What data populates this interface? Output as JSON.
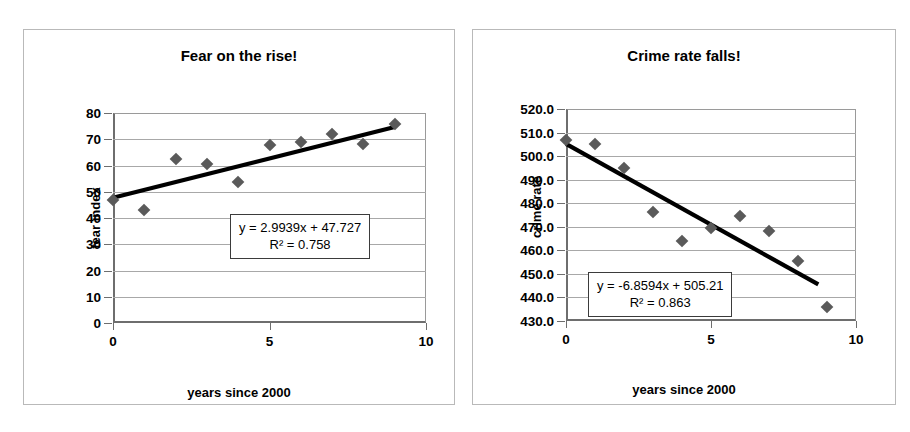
{
  "page": {
    "background": "#ffffff",
    "frame_color": "#b9b9b9"
  },
  "panels": [
    {
      "id": "fear",
      "title": "Fear on the rise!",
      "xlabel": "years since 2000",
      "ylabel": "fear index",
      "equation": "y = 2.9939x + 47.727",
      "r_squared": "R² = 0.758",
      "yticks": [
        "0",
        "10",
        "20",
        "30",
        "40",
        "50",
        "60",
        "70",
        "80"
      ],
      "xticks": [
        "0",
        "5",
        "10"
      ]
    },
    {
      "id": "crime",
      "title": "Crime rate falls!",
      "xlabel": "years since 2000",
      "ylabel": "crime rate",
      "equation": "y = -6.8594x + 505.21",
      "r_squared": "R² = 0.863",
      "yticks": [
        "430.0",
        "440.0",
        "450.0",
        "460.0",
        "470.0",
        "480.0",
        "490.0",
        "500.0",
        "510.0",
        "520.0"
      ],
      "xticks": [
        "0",
        "5",
        "10"
      ]
    }
  ],
  "chart_data": [
    {
      "type": "scatter",
      "title": "Fear on the rise!",
      "xlabel": "years since 2000",
      "ylabel": "fear index",
      "x": [
        0,
        1,
        2,
        3,
        4,
        5,
        6,
        7,
        8,
        9
      ],
      "y": [
        47.0,
        43.0,
        62.3,
        60.5,
        53.6,
        67.7,
        69.0,
        72.0,
        68.2,
        75.8
      ],
      "xlim": [
        0,
        10
      ],
      "ylim": [
        0,
        80
      ],
      "xtick_values": [
        0,
        5,
        10
      ],
      "ytick_values": [
        0,
        10,
        20,
        30,
        40,
        50,
        60,
        70,
        80
      ],
      "grid": "horizontal",
      "legend": "none",
      "marker": "diamond",
      "marker_color": "#5a5a5a",
      "trendline": {
        "type": "linear",
        "slope": 2.9939,
        "intercept": 47.727,
        "equation": "y = 2.9939x + 47.727",
        "r_squared": 0.758,
        "label": "R² = 0.758",
        "color": "#000000",
        "x_range": [
          0,
          9
        ]
      }
    },
    {
      "type": "scatter",
      "title": "Crime rate falls!",
      "xlabel": "years since 2000",
      "ylabel": "crime rate",
      "x": [
        0,
        1,
        2,
        3,
        4,
        5,
        6,
        7,
        8,
        9
      ],
      "y": [
        507.0,
        505.0,
        495.0,
        476.3,
        464.0,
        469.5,
        474.5,
        468.0,
        455.5,
        436.0
      ],
      "xlim": [
        0,
        10
      ],
      "ylim": [
        430.0,
        520.0
      ],
      "xtick_values": [
        0,
        5,
        10
      ],
      "ytick_values": [
        430.0,
        440.0,
        450.0,
        460.0,
        470.0,
        480.0,
        490.0,
        500.0,
        510.0,
        520.0
      ],
      "grid": "horizontal",
      "legend": "none",
      "marker": "diamond",
      "marker_color": "#5a5a5a",
      "trendline": {
        "type": "linear",
        "slope": -6.8594,
        "intercept": 505.21,
        "equation": "y = -6.8594x + 505.21",
        "r_squared": 0.863,
        "label": "R² = 0.863",
        "color": "#000000",
        "x_range": [
          0,
          8.7
        ]
      }
    }
  ]
}
